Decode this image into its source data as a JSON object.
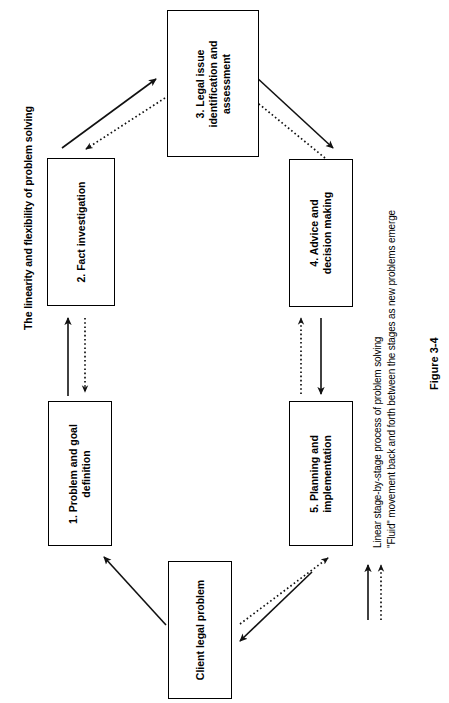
{
  "figure": {
    "title": "The linearity and flexibility of problem solving",
    "caption": "Figure 3-4"
  },
  "nodes": {
    "client": "Client legal problem",
    "stage1": "1. Problem and goal\ndefinition",
    "stage2": "2. Fact investigation",
    "stage3": "3. Legal issue\nidentification and\nassessment",
    "stage4": "4. Advice and\ndecision making",
    "stage5": "5. Planning and\nimplementation"
  },
  "legend": {
    "items": [
      {
        "marker": "solid-arrow",
        "label": "Linear stage-by-stage process of problem solving"
      },
      {
        "marker": "dotted-arrow",
        "label": "\"Fluid\" movement back and forth between the stages as new problems emerge"
      }
    ]
  },
  "connections": [
    {
      "from": "client",
      "to": "stage1",
      "style": "solid-arrow"
    },
    {
      "from": "stage1",
      "to": "stage2",
      "style": "solid-arrow"
    },
    {
      "from": "stage2",
      "to": "stage1",
      "style": "dotted-arrow"
    },
    {
      "from": "stage2",
      "to": "stage3",
      "style": "solid-arrow"
    },
    {
      "from": "stage3",
      "to": "stage2",
      "style": "dotted-arrow"
    },
    {
      "from": "stage3",
      "to": "stage4",
      "style": "solid-arrow"
    },
    {
      "from": "stage4",
      "to": "stage3",
      "style": "dotted-arrow"
    },
    {
      "from": "stage4",
      "to": "stage5",
      "style": "solid-arrow"
    },
    {
      "from": "stage5",
      "to": "stage4",
      "style": "dotted-arrow"
    },
    {
      "from": "stage5",
      "to": "client",
      "style": "solid-arrow"
    },
    {
      "from": "client",
      "to": "stage5",
      "style": "dotted-arrow"
    }
  ],
  "colors": {
    "ink": "#111111",
    "paper": "#ffffff"
  }
}
